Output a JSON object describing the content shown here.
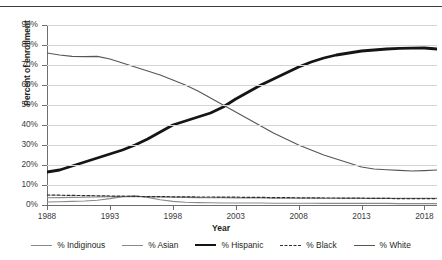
{
  "chart_data": {
    "type": "line",
    "title": "",
    "xlabel": "Year",
    "ylabel": "Percent of enrollment",
    "xlim": [
      1988,
      2019
    ],
    "ylim": [
      0,
      90
    ],
    "grid": true,
    "legend_position": "bottom",
    "x_ticks": [
      "1988",
      "1993",
      "1998",
      "2003",
      "2008",
      "2013",
      "2018"
    ],
    "y_ticks": [
      "0%",
      "10%",
      "20%",
      "30%",
      "40%",
      "50%",
      "60%",
      "70%",
      "80%",
      "90%"
    ],
    "x": [
      1988,
      1989,
      1990,
      1991,
      1992,
      1993,
      1994,
      1995,
      1996,
      1997,
      1998,
      1999,
      2000,
      2001,
      2002,
      2003,
      2004,
      2005,
      2006,
      2007,
      2008,
      2009,
      2010,
      2011,
      2012,
      2013,
      2014,
      2015,
      2016,
      2017,
      2018,
      2019
    ],
    "series": [
      {
        "name": "% Indiginous",
        "style": "thin-solid",
        "color": "#8a8a8a",
        "values": [
          1.5,
          1.6,
          1.8,
          2.0,
          2.4,
          3.2,
          4.2,
          4.6,
          3.8,
          2.6,
          1.8,
          1.4,
          1.2,
          1.1,
          1.0,
          1.0,
          1.0,
          1.0,
          0.9,
          0.9,
          0.9,
          0.9,
          0.8,
          0.8,
          0.8,
          0.8,
          0.8,
          0.8,
          0.7,
          0.7,
          0.7,
          0.7
        ]
      },
      {
        "name": "% Asian",
        "style": "thin-solid",
        "color": "#8a8a8a",
        "values": [
          3.6,
          3.7,
          3.8,
          3.9,
          4.0,
          4.1,
          4.2,
          4.2,
          4.1,
          4.0,
          3.9,
          3.8,
          3.7,
          3.6,
          3.6,
          3.5,
          3.5,
          3.5,
          3.4,
          3.4,
          3.4,
          3.4,
          3.4,
          3.4,
          3.4,
          3.4,
          3.4,
          3.4,
          3.4,
          3.4,
          3.4,
          3.4
        ]
      },
      {
        "name": "% Hispanic",
        "style": "thick-solid",
        "color": "#151515",
        "values": [
          16.5,
          17.5,
          19.5,
          21.5,
          23.5,
          25.5,
          27.5,
          30.0,
          33.0,
          36.5,
          40.0,
          42.0,
          44.0,
          46.0,
          49.0,
          53.0,
          56.5,
          60.0,
          63.0,
          66.0,
          69.0,
          71.5,
          73.5,
          75.0,
          76.0,
          77.0,
          77.5,
          78.0,
          78.3,
          78.4,
          78.5,
          78.0
        ]
      },
      {
        "name": "% Black",
        "style": "dashed",
        "color": "#2e2e2e",
        "values": [
          5.0,
          4.9,
          4.8,
          4.7,
          4.6,
          4.5,
          4.4,
          4.3,
          4.2,
          4.2,
          4.1,
          4.1,
          4.0,
          4.0,
          3.9,
          3.9,
          3.8,
          3.8,
          3.7,
          3.7,
          3.6,
          3.6,
          3.5,
          3.5,
          3.4,
          3.4,
          3.3,
          3.3,
          3.2,
          3.2,
          3.2,
          3.2
        ]
      },
      {
        "name": "% White",
        "style": "thin-solid",
        "color": "#565656",
        "values": [
          76.0,
          75.0,
          74.3,
          74.2,
          74.3,
          73.0,
          71.0,
          69.0,
          67.0,
          65.0,
          62.5,
          60.0,
          57.0,
          53.5,
          50.0,
          46.5,
          43.0,
          39.5,
          36.0,
          33.0,
          30.0,
          27.5,
          25.0,
          23.0,
          21.0,
          19.0,
          18.0,
          17.6,
          17.3,
          17.0,
          17.2,
          17.5
        ]
      }
    ]
  },
  "legend": {
    "items": [
      {
        "label": "% Indiginous",
        "style": "thin-solid"
      },
      {
        "label": "% Asian",
        "style": "thin-solid"
      },
      {
        "label": "% Hispanic",
        "style": "thick-solid"
      },
      {
        "label": "% Black",
        "style": "dashed"
      },
      {
        "label": "% White",
        "style": "thin-solid"
      }
    ]
  }
}
